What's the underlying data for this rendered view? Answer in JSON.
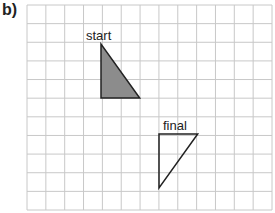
{
  "part_label": "b)",
  "grid": {
    "columns": 13,
    "rows": 11,
    "line_color": "#c8c8c8"
  },
  "shapes": [
    {
      "name": "start",
      "label": "start",
      "fill": "#8c8c8c",
      "stroke": "#222222",
      "vertices": [
        [
          4,
          2
        ],
        [
          4,
          5
        ],
        [
          6,
          5
        ]
      ]
    },
    {
      "name": "final",
      "label": "final",
      "fill": "none",
      "stroke": "#222222",
      "vertices": [
        [
          7,
          7
        ],
        [
          9,
          7
        ],
        [
          7,
          10
        ]
      ]
    }
  ]
}
